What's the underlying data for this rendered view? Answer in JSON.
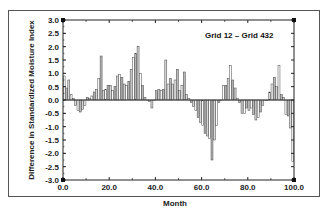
{
  "chart_data": {
    "type": "bar",
    "title": "Grid 12 – Grid 432",
    "xlabel": "Month",
    "ylabel": "Difference in Standardized Moisture Index",
    "xlim": [
      0,
      100
    ],
    "ylim": [
      -3.0,
      3.0
    ],
    "grid": false,
    "legend": null,
    "x_ticks": [
      "0.0",
      "20.0",
      "40.0",
      "60.0",
      "80.0",
      "100.0"
    ],
    "y_ticks": [
      "3.0",
      "2.5",
      "2.0",
      "1.5",
      "1.0",
      "0.5",
      "0.0",
      "-0.5",
      "-1.0",
      "-1.5",
      "-2.0",
      "-2.5",
      "-3.0"
    ],
    "x": [
      1,
      2,
      3,
      4,
      5,
      6,
      7,
      8,
      9,
      10,
      11,
      12,
      13,
      14,
      15,
      16,
      17,
      18,
      19,
      20,
      21,
      22,
      23,
      24,
      25,
      26,
      27,
      28,
      29,
      30,
      31,
      32,
      33,
      34,
      35,
      36,
      37,
      38,
      39,
      40,
      41,
      42,
      43,
      44,
      45,
      46,
      47,
      48,
      49,
      50,
      51,
      52,
      53,
      54,
      55,
      56,
      57,
      58,
      59,
      60,
      61,
      62,
      63,
      64,
      65,
      66,
      67,
      68,
      69,
      70,
      71,
      72,
      73,
      74,
      75,
      76,
      77,
      78,
      79,
      80,
      81,
      82,
      83,
      84,
      85,
      86,
      87,
      88,
      89,
      90,
      91,
      92,
      93,
      94,
      95,
      96,
      97,
      98,
      99,
      100
    ],
    "values": [
      0.9,
      0.45,
      0.75,
      0.2,
      0.05,
      -0.2,
      -0.4,
      -0.45,
      -0.35,
      -0.2,
      0.1,
      0.05,
      0.15,
      0.3,
      0.4,
      0.8,
      1.65,
      0.35,
      0.4,
      0.55,
      0.55,
      0.35,
      0.5,
      0.9,
      0.95,
      0.85,
      0.6,
      0.55,
      0.7,
      1.15,
      1.6,
      1.75,
      2.0,
      1.0,
      0.55,
      0.1,
      0.0,
      -0.05,
      -0.3,
      0.0,
      0.35,
      0.4,
      0.35,
      0.4,
      1.5,
      0.6,
      0.8,
      0.6,
      0.75,
      1.15,
      0.35,
      0.55,
      1.05,
      0.2,
      0.05,
      -0.1,
      -0.25,
      -0.4,
      -0.65,
      -0.85,
      -0.95,
      -1.25,
      -1.35,
      -1.45,
      -2.25,
      -1.5,
      -0.95,
      -0.1,
      0.0,
      0.55,
      0.55,
      0.8,
      1.3,
      0.75,
      0.45,
      0.05,
      -0.1,
      -0.5,
      -0.5,
      -0.3,
      -0.4,
      -0.3,
      -0.55,
      -0.75,
      -0.65,
      -0.45,
      -0.2,
      0.0,
      0.0,
      0.3,
      0.6,
      0.85,
      0.5,
      1.3,
      0.2,
      0.1,
      -0.55,
      -0.6,
      -1.05,
      -2.3
    ]
  }
}
